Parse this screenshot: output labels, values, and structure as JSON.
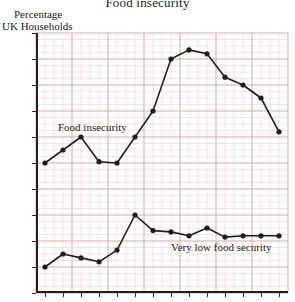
{
  "title": "Food insecurity",
  "y_axis": {
    "caption_line1": "Percentage",
    "caption_line2": "UK Households",
    "ticks": [
      "0",
      "2",
      "4",
      "6",
      "8",
      "10",
      "12",
      "14",
      "16",
      "18",
      "20"
    ]
  },
  "annotations": {
    "series1_label": "Food insecurity",
    "series2_label": "Very low food security"
  },
  "colors": {
    "grid_minor": "#e9c8c8",
    "grid_major": "#c9a0a0",
    "line": "#1f1f1f",
    "axis": "#1f1f1f",
    "background": "#ffffff"
  },
  "chart_data": {
    "type": "line",
    "title": "Food insecurity",
    "xlabel": "",
    "ylabel": "Percentage UK Households",
    "ylim": [
      0,
      20
    ],
    "ytick_step": 2,
    "grid": true,
    "legend": "inline-annotations",
    "x": [
      1,
      2,
      3,
      4,
      5,
      6,
      7,
      8,
      9,
      10,
      11,
      12,
      13,
      14
    ],
    "xtick_labels": [
      "",
      "",
      "",
      "",
      "",
      "",
      "",
      "",
      "",
      "",
      "",
      "",
      "",
      ""
    ],
    "series": [
      {
        "name": "Food insecurity",
        "values": [
          10.0,
          11.0,
          12.0,
          10.1,
          10.0,
          12.0,
          14.0,
          18.0,
          18.7,
          18.4,
          16.6,
          16.0,
          15.0,
          12.4
        ]
      },
      {
        "name": "Very low food security",
        "values": [
          2.0,
          3.0,
          2.7,
          2.4,
          3.3,
          6.0,
          4.8,
          4.7,
          4.4,
          5.0,
          4.3,
          4.4,
          4.4,
          4.4
        ]
      }
    ]
  }
}
